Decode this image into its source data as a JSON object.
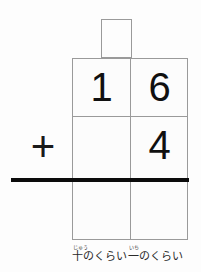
{
  "worksheet": {
    "title": "vertical-addition-place-value-worksheet",
    "background_color": "#fdfdfd",
    "grid_line_color": "#9a9a9a",
    "rule_color": "#0b0b0b",
    "digit_color": "#101010"
  },
  "carry_box": {
    "name": "carry-box",
    "value": ""
  },
  "problem": {
    "operator": "+",
    "rows": [
      {
        "name": "addend-row-1",
        "cells": [
          {
            "place": "tens",
            "value": "1"
          },
          {
            "place": "ones",
            "value": "6"
          }
        ]
      },
      {
        "name": "addend-row-2",
        "cells": [
          {
            "place": "tens",
            "value": ""
          },
          {
            "place": "ones",
            "value": "4"
          }
        ]
      },
      {
        "name": "answer-row",
        "cells": [
          {
            "place": "tens",
            "value": ""
          },
          {
            "place": "ones",
            "value": ""
          }
        ]
      }
    ]
  },
  "captions": {
    "tens": {
      "furigana": "じゅう",
      "text": "十のくらい"
    },
    "ones": {
      "furigana": "いち",
      "text": "一のくらい"
    }
  }
}
